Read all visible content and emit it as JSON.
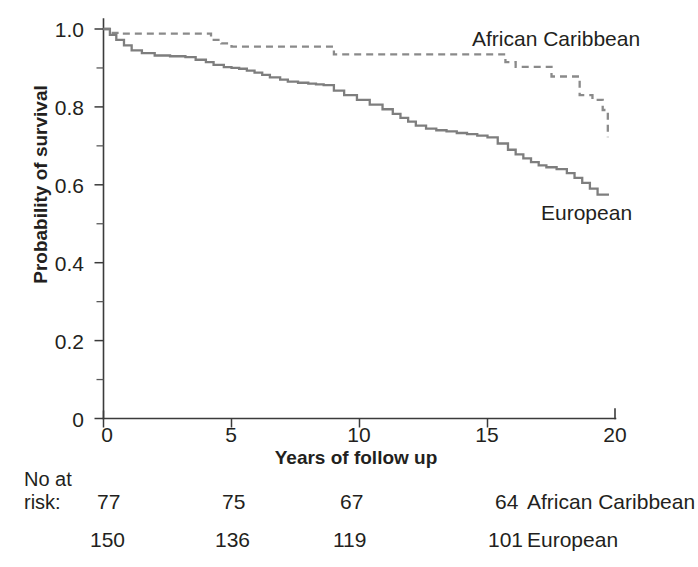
{
  "figure": {
    "background": "#ffffff",
    "curve_color": "#7e7e7e",
    "text_color": "#231f20"
  },
  "axes": {
    "y_title": "Probability of survival",
    "x_title": "Years of follow up",
    "y_ticks": [
      "0",
      "0.2",
      "0.4",
      "0.6",
      "0.8",
      "1.0"
    ],
    "x_ticks": [
      "0",
      "5",
      "10",
      "15",
      "20"
    ]
  },
  "series_labels": {
    "african_caribbean": "African Caribbean",
    "european": "European"
  },
  "risk_table": {
    "header_line1": "No at",
    "header_line2": "risk:",
    "rows": [
      {
        "name": "African Caribbean",
        "values": [
          "77",
          "75",
          "67",
          "64"
        ]
      },
      {
        "name": "European",
        "values": [
          "150",
          "136",
          "119",
          "101"
        ]
      }
    ]
  },
  "chart_data": {
    "type": "line",
    "title": "",
    "subtitle": "",
    "xlabel": "Years of follow up",
    "ylabel": "Probability of survival",
    "xlim": [
      0,
      20
    ],
    "ylim": [
      0,
      1.0
    ],
    "xticks": [
      0,
      5,
      10,
      15,
      20
    ],
    "yticks": [
      0,
      0.2,
      0.4,
      0.6,
      0.8,
      1.0
    ],
    "y_minor_ticks": [
      0.1,
      0.3,
      0.5,
      0.7,
      0.9
    ],
    "grid": false,
    "legend_position": "inline-annotation",
    "step_style": "post",
    "series": [
      {
        "name": "African Caribbean",
        "style": "dashed",
        "color": "#8a8a8a",
        "annotation": "African Caribbean",
        "annotation_xy": [
          14.5,
          0.975
        ],
        "x": [
          0,
          0.3,
          0.7,
          3.8,
          4.2,
          4.6,
          5.0,
          8.6,
          9.0,
          15.3,
          15.7,
          16.1,
          17.1,
          17.5,
          18.0,
          18.6,
          19.1,
          19.5,
          19.7
        ],
        "y": [
          1.0,
          0.99,
          0.988,
          0.988,
          0.972,
          0.963,
          0.955,
          0.955,
          0.935,
          0.935,
          0.915,
          0.903,
          0.903,
          0.878,
          0.878,
          0.83,
          0.818,
          0.792,
          0.722
        ]
      },
      {
        "name": "European",
        "style": "solid",
        "color": "#7e7e7e",
        "annotation": "European",
        "annotation_xy": [
          17.1,
          0.52
        ],
        "x": [
          0,
          0.25,
          0.5,
          0.8,
          1.1,
          1.5,
          2.0,
          2.6,
          3.2,
          3.6,
          4.0,
          4.3,
          4.7,
          5.0,
          5.3,
          5.6,
          5.9,
          6.2,
          6.5,
          6.9,
          7.2,
          7.6,
          8.0,
          8.3,
          8.6,
          9.0,
          9.4,
          9.9,
          10.4,
          10.9,
          11.3,
          11.6,
          11.9,
          12.2,
          12.6,
          13.0,
          13.4,
          13.8,
          14.2,
          14.6,
          15.0,
          15.4,
          15.8,
          16.1,
          16.4,
          16.7,
          17.0,
          17.3,
          17.7,
          18.1,
          18.4,
          18.7,
          19.0,
          19.3,
          19.7
        ],
        "y": [
          1.0,
          0.985,
          0.972,
          0.958,
          0.945,
          0.938,
          0.932,
          0.93,
          0.928,
          0.921,
          0.915,
          0.908,
          0.902,
          0.9,
          0.898,
          0.893,
          0.888,
          0.882,
          0.876,
          0.87,
          0.865,
          0.862,
          0.86,
          0.858,
          0.856,
          0.842,
          0.83,
          0.818,
          0.806,
          0.794,
          0.782,
          0.772,
          0.762,
          0.752,
          0.744,
          0.74,
          0.737,
          0.733,
          0.73,
          0.726,
          0.722,
          0.706,
          0.69,
          0.678,
          0.668,
          0.658,
          0.65,
          0.645,
          0.64,
          0.63,
          0.618,
          0.605,
          0.59,
          0.575,
          0.572
        ]
      }
    ]
  }
}
